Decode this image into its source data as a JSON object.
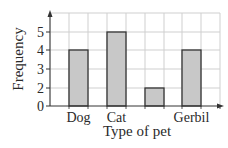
{
  "chart_data": {
    "type": "bar",
    "title": "",
    "xlabel": "Type of pet",
    "ylabel": "Frequency",
    "categories": [
      "Dog",
      "Cat",
      "",
      "Gerbil"
    ],
    "values": [
      4,
      5,
      2,
      4
    ],
    "y_tick_labels": [
      "0",
      "2",
      "3",
      "4",
      "5"
    ],
    "ylim": [
      0,
      6
    ],
    "grid": true,
    "legend": null
  },
  "colors": {
    "bar_fill": "#c8c8c8",
    "bar_stroke": "#333333",
    "grid": "#cfcfcf",
    "axis": "#333333"
  }
}
